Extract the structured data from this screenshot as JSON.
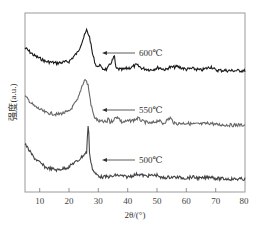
{
  "chart_data": {
    "type": "line",
    "title": "",
    "xlabel": "2θ/(°)",
    "ylabel": "强度(a.u.)",
    "xlim": [
      5,
      80
    ],
    "xticks": [
      10,
      20,
      30,
      40,
      50,
      60,
      70,
      80
    ],
    "yticks": [],
    "grid": false,
    "legend": "none (inline arrow annotations)",
    "series": [
      {
        "name": "600℃",
        "color": "#1a1a1a",
        "offset": 2.0,
        "x": [
          5,
          8,
          12,
          16,
          20,
          23,
          25,
          26,
          27,
          28,
          29,
          30,
          30.5,
          31,
          33,
          35.5,
          36,
          38,
          41,
          43,
          45,
          48,
          50.5,
          53,
          54,
          57,
          60,
          62,
          65,
          68.5,
          70,
          75,
          80
        ],
        "y": [
          0.55,
          0.38,
          0.24,
          0.2,
          0.24,
          0.45,
          0.78,
          0.95,
          0.8,
          0.42,
          0.18,
          0.1,
          0.2,
          0.08,
          0.06,
          0.35,
          0.08,
          0.05,
          0.1,
          0.16,
          0.08,
          0.05,
          0.1,
          0.05,
          0.1,
          0.12,
          0.06,
          0.08,
          0.04,
          0.12,
          0.04,
          0.03,
          0.03
        ]
      },
      {
        "name": "550℃",
        "color": "#666666",
        "offset": 1.0,
        "x": [
          5,
          8,
          12,
          16,
          20,
          23,
          24.5,
          25.5,
          26.5,
          27.5,
          28.5,
          30,
          33,
          33.5,
          34,
          36.5,
          38,
          42,
          43.5,
          45,
          48,
          50.5,
          52,
          54.5,
          56,
          60,
          62,
          65,
          68.5,
          70,
          75,
          80
        ],
        "y": [
          0.62,
          0.42,
          0.28,
          0.24,
          0.3,
          0.55,
          0.85,
          0.98,
          0.85,
          0.45,
          0.2,
          0.1,
          0.08,
          0.18,
          0.07,
          0.2,
          0.08,
          0.12,
          0.16,
          0.1,
          0.05,
          0.12,
          0.05,
          0.17,
          0.05,
          0.06,
          0.04,
          0.04,
          0.06,
          0.03,
          0.02,
          0.02
        ]
      },
      {
        "name": "500℃",
        "color": "#444444",
        "offset": 0.0,
        "x": [
          5,
          8,
          12,
          16,
          20,
          21.5,
          23,
          25,
          26,
          26.6,
          27,
          28,
          29,
          31,
          35,
          36,
          40,
          43.5,
          46,
          50.5,
          51,
          55,
          60,
          62,
          65,
          68.5,
          70,
          75,
          80
        ],
        "y": [
          0.72,
          0.45,
          0.25,
          0.2,
          0.26,
          0.34,
          0.38,
          0.5,
          0.55,
          1.2,
          0.52,
          0.22,
          0.12,
          0.06,
          0.07,
          0.1,
          0.06,
          0.12,
          0.08,
          0.1,
          0.04,
          0.06,
          0.04,
          0.06,
          0.03,
          0.07,
          0.03,
          0.02,
          0.02
        ]
      }
    ],
    "annotations": [
      {
        "text": "600℃",
        "arrow_to_x": 28.5,
        "series": "600℃"
      },
      {
        "text": "550℃",
        "arrow_to_x": 28.5,
        "series": "550℃"
      },
      {
        "text": "500℃",
        "arrow_to_x": 28.5,
        "series": "500℃"
      }
    ]
  },
  "labels": {
    "xlabel": "2θ/(°)",
    "ylabel": "强度(a.u.)",
    "anno_600": "600℃",
    "anno_550": "550℃",
    "anno_500": "500℃",
    "tick_10": "10",
    "tick_20": "20",
    "tick_30": "30",
    "tick_40": "40",
    "tick_50": "50",
    "tick_60": "60",
    "tick_70": "70",
    "tick_80": "80"
  }
}
